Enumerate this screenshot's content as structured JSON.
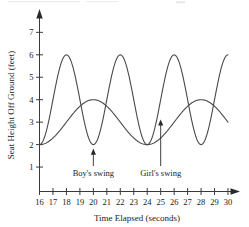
{
  "chart_data": {
    "type": "line",
    "title": "",
    "xlabel": "Time Elapsed (seconds)",
    "ylabel": "Seat Height Off Ground (feet)",
    "xlim": [
      16,
      30
    ],
    "ylim": [
      0,
      7.6
    ],
    "grid": false,
    "legend_position": "none",
    "xticks": [
      16,
      17,
      18,
      19,
      20,
      21,
      22,
      23,
      24,
      25,
      26,
      27,
      28,
      29,
      30
    ],
    "xticklabels": [
      "16",
      "17",
      "18",
      "19",
      "20",
      "21",
      "22",
      "23",
      "24",
      "25",
      "26",
      "27",
      "28",
      "29",
      "30"
    ],
    "yticks": [
      1,
      2,
      3,
      4,
      5,
      6,
      7
    ],
    "yticklabels": [
      "1",
      "2",
      "3",
      "4",
      "5",
      "6",
      "7"
    ],
    "series": [
      {
        "name": "Boy's swing",
        "midline": 4,
        "amplitude": 2,
        "period": 4,
        "min_value": 2,
        "max_value": 6,
        "phase_min_at": 16,
        "minima_x": [
          16,
          20,
          24,
          28
        ],
        "maxima_x": [
          18,
          22,
          26,
          30
        ],
        "x": [
          16,
          16.5,
          17,
          17.5,
          18,
          18.5,
          19,
          19.5,
          20,
          20.5,
          21,
          21.5,
          22,
          22.5,
          23,
          23.5,
          24,
          24.5,
          25,
          25.5,
          26,
          26.5,
          27,
          27.5,
          28,
          28.5,
          29,
          29.5,
          30
        ],
        "values": [
          2.0,
          2.59,
          4.0,
          5.41,
          6.0,
          5.41,
          4.0,
          2.59,
          2.0,
          2.59,
          4.0,
          5.41,
          6.0,
          5.41,
          4.0,
          2.59,
          2.0,
          2.59,
          4.0,
          5.41,
          6.0,
          5.41,
          4.0,
          2.59,
          2.0,
          2.59,
          4.0,
          5.41,
          6.0
        ]
      },
      {
        "name": "Girl's swing",
        "midline": 3,
        "amplitude": 1,
        "period": 8,
        "min_value": 2,
        "max_value": 4,
        "phase_min_at": 16,
        "minima_x": [
          16,
          24
        ],
        "maxima_x": [
          20,
          28
        ],
        "x": [
          16,
          16.5,
          17,
          17.5,
          18,
          18.5,
          19,
          19.5,
          20,
          20.5,
          21,
          21.5,
          22,
          22.5,
          23,
          23.5,
          24,
          24.5,
          25,
          25.5,
          26,
          26.5,
          27,
          27.5,
          28,
          28.5,
          29,
          29.5,
          30
        ],
        "values": [
          2.0,
          2.04,
          2.15,
          2.32,
          2.5,
          2.68,
          2.85,
          2.96,
          3.0,
          3.96,
          3.85,
          3.68,
          3.5,
          3.32,
          3.15,
          3.04,
          2.0,
          2.04,
          2.15,
          2.32,
          2.5,
          2.68,
          2.85,
          2.96,
          4.0,
          3.96,
          3.85,
          3.68,
          3.5
        ]
      }
    ],
    "annotations": [
      {
        "label": "Boy's swing",
        "points_to_x": 20,
        "points_to_y": 2
      },
      {
        "label": "Girl's swing",
        "points_to_x": 25,
        "points_to_y": 3.3
      }
    ]
  },
  "axes": {
    "x_title": "Time Elapsed (seconds)",
    "y_title": "Seat Height Off Ground (feet)"
  },
  "annotations": {
    "boy": "Boy's swing",
    "girl": "Girl's swing"
  },
  "ticks": {
    "x": [
      "16",
      "17",
      "18",
      "19",
      "20",
      "21",
      "22",
      "23",
      "24",
      "25",
      "26",
      "27",
      "28",
      "29",
      "30"
    ],
    "y": [
      "1",
      "2",
      "3",
      "4",
      "5",
      "6",
      "7"
    ]
  }
}
